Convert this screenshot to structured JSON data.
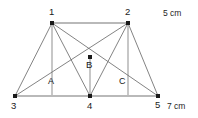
{
  "figure": {
    "title_visible": false,
    "background_color": "#ffffff",
    "line_color_rail": "#b9b9b9",
    "line_color_web": "#6d6d6d",
    "node_color": "#1a1a1a",
    "nodes": [
      {
        "id": "n1",
        "label": "1",
        "x": 52,
        "y": 23,
        "label_x": 49,
        "label_y": 7
      },
      {
        "id": "n2",
        "label": "2",
        "x": 128,
        "y": 23,
        "label_x": 125,
        "label_y": 7
      },
      {
        "id": "n3",
        "label": "3",
        "x": 15,
        "y": 96,
        "label_x": 11,
        "label_y": 101
      },
      {
        "id": "n4",
        "label": "4",
        "x": 90,
        "y": 96,
        "label_x": 87,
        "label_y": 101
      },
      {
        "id": "n5",
        "label": "5",
        "x": 158,
        "y": 96,
        "label_x": 155,
        "label_y": 100
      },
      {
        "id": "nB",
        "label": "B",
        "x": 90,
        "y": 57,
        "label_x": 86,
        "label_y": 60
      }
    ],
    "midpoint_labels": [
      {
        "id": "mA",
        "label": "A",
        "x": 48,
        "y": 77
      },
      {
        "id": "mC",
        "label": "C",
        "x": 119,
        "y": 77
      }
    ],
    "dimensions": [
      {
        "id": "dim_top",
        "label": "5 cm",
        "x": 163,
        "y": 8
      },
      {
        "id": "dim_bottom",
        "label": "7 cm",
        "x": 167,
        "y": 101
      }
    ],
    "edges": [
      {
        "id": "e_top_rail",
        "kind": "rail",
        "x1": 52,
        "y1": 23,
        "x2": 128,
        "y2": 23
      },
      {
        "id": "e_bottom_rail",
        "kind": "rail",
        "x1": 15,
        "y1": 96,
        "x2": 158,
        "y2": 96
      },
      {
        "id": "e_vert_1",
        "kind": "strut",
        "x1": 52,
        "y1": 23,
        "x2": 52,
        "y2": 96
      },
      {
        "id": "e_vert_2",
        "kind": "strut",
        "x1": 128,
        "y1": 23,
        "x2": 128,
        "y2": 96
      },
      {
        "id": "e_vert_B4",
        "kind": "strut",
        "x1": 90,
        "y1": 57,
        "x2": 90,
        "y2": 96
      },
      {
        "id": "e_1_3",
        "kind": "web",
        "x1": 52,
        "y1": 23,
        "x2": 15,
        "y2": 96
      },
      {
        "id": "e_1_4",
        "kind": "web",
        "x1": 52,
        "y1": 23,
        "x2": 90,
        "y2": 96
      },
      {
        "id": "e_1_5",
        "kind": "web",
        "x1": 52,
        "y1": 23,
        "x2": 158,
        "y2": 96
      },
      {
        "id": "e_2_3",
        "kind": "web",
        "x1": 128,
        "y1": 23,
        "x2": 15,
        "y2": 96
      },
      {
        "id": "e_2_4",
        "kind": "web",
        "x1": 128,
        "y1": 23,
        "x2": 90,
        "y2": 96
      },
      {
        "id": "e_2_5",
        "kind": "web",
        "x1": 128,
        "y1": 23,
        "x2": 158,
        "y2": 96
      }
    ]
  }
}
